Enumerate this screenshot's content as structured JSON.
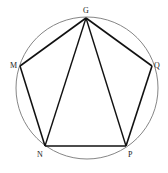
{
  "diagram": {
    "type": "inscribed-pentagon",
    "circle": {
      "cx": 87,
      "cy": 88,
      "r": 71
    },
    "points": [
      {
        "id": "G",
        "label": "G",
        "x": 86,
        "y": 18,
        "lx": 86,
        "ly": 13
      },
      {
        "id": "Q",
        "label": "Q",
        "x": 152,
        "y": 66,
        "lx": 158,
        "ly": 68
      },
      {
        "id": "P",
        "label": "P",
        "x": 126,
        "y": 146,
        "lx": 130,
        "ly": 156
      },
      {
        "id": "N",
        "label": "N",
        "x": 45,
        "y": 146,
        "lx": 41,
        "ly": 156
      },
      {
        "id": "M",
        "label": "M",
        "x": 20,
        "y": 66,
        "lx": 14,
        "ly": 68
      }
    ],
    "segments": [
      [
        "G",
        "Q"
      ],
      [
        "Q",
        "P"
      ],
      [
        "P",
        "N"
      ],
      [
        "N",
        "M"
      ],
      [
        "M",
        "G"
      ],
      [
        "G",
        "N"
      ],
      [
        "G",
        "P"
      ]
    ],
    "colors": {
      "stroke": "#111111",
      "circle": "#777777"
    }
  }
}
